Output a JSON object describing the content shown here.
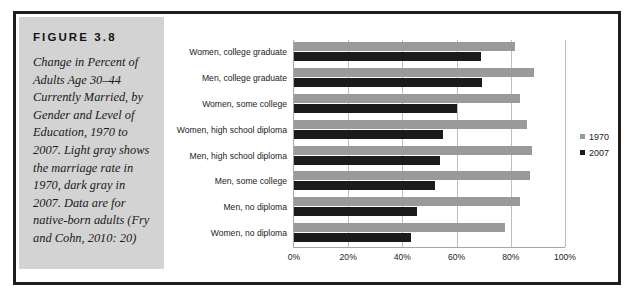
{
  "figure": {
    "label": "FIGURE 3.8",
    "caption": "Change in Percent of Adults Age 30–44 Currently Married, by Gender and Level of Education, 1970 to 2007. Light gray shows the marriage rate in 1970, dark gray in 2007. Data are for native-born adults (Fry and Cohn, 2010: 20)"
  },
  "colors": {
    "panel_background": "#d3d3d3",
    "frame_border": "#1d1d1d",
    "series_1970": "#9a9a9a",
    "series_2007": "#1b1b1b",
    "gridline": "#bdbdbd",
    "axis": "#a6a6a6"
  },
  "chart_data": {
    "type": "bar",
    "orientation": "horizontal",
    "title": "",
    "xlabel": "",
    "ylabel": "",
    "xlim": [
      0,
      100
    ],
    "grid": true,
    "legend_position": "right",
    "tick_labels": [
      "0%",
      "20%",
      "40%",
      "60%",
      "80%",
      "100%"
    ],
    "ticks": [
      0,
      20,
      40,
      60,
      80,
      100
    ],
    "categories": [
      "Women, college graduate",
      "Men, college graduate",
      "Women, some college",
      "Women, high school diploma",
      "Men, high school diploma",
      "Men, some college",
      "Men, no diploma",
      "Women, no diploma"
    ],
    "series": [
      {
        "name": "1970",
        "color": "#9a9a9a",
        "values": [
          81.5,
          88.5,
          83.5,
          86.0,
          88.0,
          87.0,
          83.5,
          78.0
        ]
      },
      {
        "name": "2007",
        "color": "#1b1b1b",
        "values": [
          69.0,
          69.5,
          60.0,
          55.0,
          54.0,
          52.0,
          45.5,
          43.0
        ]
      }
    ]
  }
}
